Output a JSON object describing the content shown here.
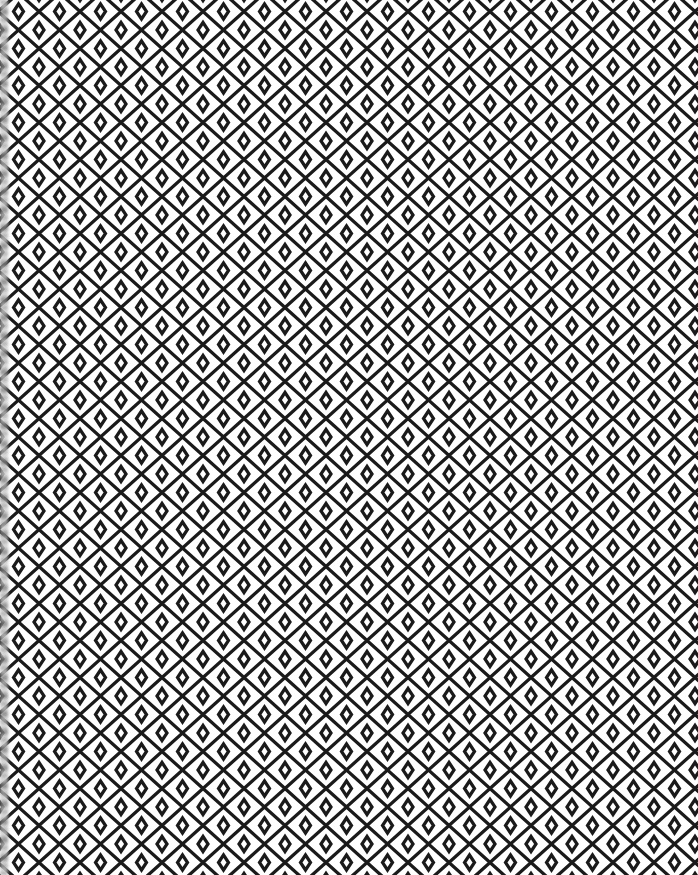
{
  "image": {
    "description": "Black geometric lattice pattern on white background: zigzag diagonal lines forming large diamonds with small diamonds at intersections",
    "colors": {
      "background": "#ffffff",
      "line": "#1a1a1a"
    },
    "pattern": {
      "period_x": 41,
      "period_y": 37,
      "stroke_width": 3.2
    }
  }
}
